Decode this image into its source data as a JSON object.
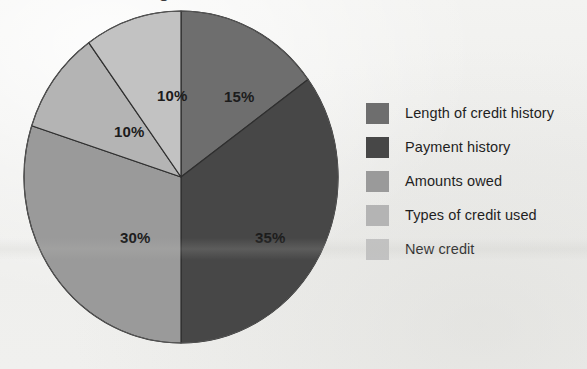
{
  "page": {
    "background_color": "#f1f1ef",
    "cropped_title_fragment": "o"
  },
  "chart_data": {
    "type": "pie",
    "title": "",
    "subtitle": "",
    "xlabel": "",
    "ylabel": "",
    "grid": false,
    "legend_position": "right",
    "start_angle_deg": 0,
    "direction": "clockwise",
    "categories": [
      "Length of credit history",
      "Payment history",
      "Amounts owed",
      "Types of credit used",
      "New credit"
    ],
    "values": [
      15,
      35,
      30,
      10,
      10
    ],
    "value_unit": "%",
    "data_labels": [
      "15%",
      "35%",
      "30%",
      "10%",
      "10%"
    ],
    "colors": [
      "#6e6e6e",
      "#474747",
      "#9a9a9a",
      "#b4b4b4",
      "#c2c2c2"
    ],
    "slices": [
      {
        "name": "Length of credit history",
        "label": "15%",
        "value": 15,
        "color": "#6e6e6e",
        "start_deg": 0,
        "end_deg": 54,
        "label_left": "202px",
        "label_top": "78px"
      },
      {
        "name": "Payment history",
        "label": "35%",
        "value": 35,
        "color": "#474747",
        "start_deg": 54,
        "end_deg": 180,
        "label_left": "233px",
        "label_top": "219px"
      },
      {
        "name": "Amounts owed",
        "label": "30%",
        "value": 30,
        "color": "#9a9a9a",
        "start_deg": 180,
        "end_deg": 288,
        "label_left": "98px",
        "label_top": "219px"
      },
      {
        "name": "Types of credit used",
        "label": "10%",
        "value": 10,
        "color": "#b4b4b4",
        "start_deg": 288,
        "end_deg": 324,
        "label_left": "92px",
        "label_top": "113px"
      },
      {
        "name": "New credit",
        "label": "10%",
        "value": 10,
        "color": "#c2c2c2",
        "start_deg": 324,
        "end_deg": 360,
        "label_left": "135px",
        "label_top": "77px"
      }
    ],
    "stroke_color": "#2f2f2f",
    "stroke_width": 1.2
  },
  "legend": {
    "items": [
      {
        "label": "Length of credit history",
        "color": "#6e6e6e"
      },
      {
        "label": "Payment history",
        "color": "#474747"
      },
      {
        "label": "Amounts owed",
        "color": "#9a9a9a"
      },
      {
        "label": "Types of credit used",
        "color": "#b4b4b4"
      },
      {
        "label": "New credit",
        "color": "#c2c2c2"
      }
    ]
  }
}
